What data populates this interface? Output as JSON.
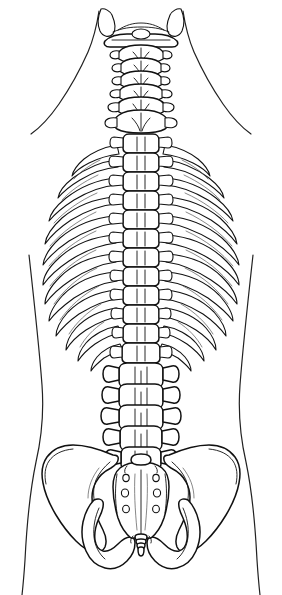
{
  "figure": {
    "view": "posterior",
    "background_color": "#ffffff",
    "line_color": "#111111",
    "silhouette_color": "#222222",
    "width": 282,
    "height": 595
  },
  "regions": [
    {
      "id": "skull-base",
      "label": "Skull base / mastoid processes",
      "y_range": [
        8,
        40
      ]
    },
    {
      "id": "cervical-spine",
      "label": "Cervical spine",
      "vertebra_count": 7,
      "y_range": [
        30,
        140
      ]
    },
    {
      "id": "thoracic-spine",
      "label": "Thoracic spine",
      "vertebra_count": 12,
      "y_range": [
        140,
        365
      ]
    },
    {
      "id": "rib-cage",
      "label": "Rib cage",
      "rib_pairs": 12,
      "y_range": [
        145,
        370
      ],
      "x_range": [
        45,
        237
      ]
    },
    {
      "id": "lumbar-spine",
      "label": "Lumbar spine",
      "vertebra_count": 5,
      "y_range": [
        362,
        460
      ]
    },
    {
      "id": "sacrum",
      "label": "Sacrum",
      "foramina_pairs": 4,
      "y_range": [
        455,
        530
      ]
    },
    {
      "id": "coccyx",
      "label": "Coccyx",
      "segments": 4,
      "y_range": [
        528,
        560
      ]
    },
    {
      "id": "pelvis-left",
      "label": "Left hip bone / ilium",
      "y_range": [
        430,
        570
      ]
    },
    {
      "id": "pelvis-right",
      "label": "Right hip bone / ilium",
      "y_range": [
        430,
        570
      ]
    },
    {
      "id": "body-silhouette",
      "label": "Body contour (neck, shoulders, waist, hips)",
      "y_range": [
        10,
        595
      ]
    }
  ],
  "cervical_vertebrae": [
    {
      "name": "C1 atlas",
      "cy": 40,
      "half_width": 36,
      "body_w": 13,
      "body_h": 7
    },
    {
      "name": "C2 axis",
      "cy": 53,
      "half_width": 20,
      "body_w": 13,
      "body_h": 9
    },
    {
      "name": "C3",
      "cy": 66,
      "half_width": 19,
      "body_w": 13,
      "body_h": 9
    },
    {
      "name": "C4",
      "cy": 79,
      "half_width": 19,
      "body_w": 13,
      "body_h": 9
    },
    {
      "name": "C5",
      "cy": 92,
      "half_width": 20,
      "body_w": 13,
      "body_h": 9
    },
    {
      "name": "C6",
      "cy": 105,
      "half_width": 21,
      "body_w": 14,
      "body_h": 10
    },
    {
      "name": "C7",
      "cy": 120,
      "half_width": 24,
      "body_w": 15,
      "body_h": 11
    }
  ],
  "thoracic_vertebrae": [
    {
      "name": "T1",
      "cy": 140,
      "half_width": 27
    },
    {
      "name": "T2",
      "cy": 159,
      "half_width": 27
    },
    {
      "name": "T3",
      "cy": 178,
      "half_width": 27
    },
    {
      "name": "T4",
      "cy": 197,
      "half_width": 27
    },
    {
      "name": "T5",
      "cy": 216,
      "half_width": 27
    },
    {
      "name": "T6",
      "cy": 235,
      "half_width": 27
    },
    {
      "name": "T7",
      "cy": 254,
      "half_width": 27
    },
    {
      "name": "T8",
      "cy": 272,
      "half_width": 26
    },
    {
      "name": "T9",
      "cy": 290,
      "half_width": 26
    },
    {
      "name": "T10",
      "cy": 308,
      "half_width": 25
    },
    {
      "name": "T11",
      "cy": 326,
      "half_width": 24
    },
    {
      "name": "T12",
      "cy": 345,
      "half_width": 23
    }
  ],
  "lumbar_vertebrae": [
    {
      "name": "L1",
      "cy": 372,
      "half_width": 34
    },
    {
      "name": "L2",
      "cy": 393,
      "half_width": 35
    },
    {
      "name": "L3",
      "cy": 414,
      "half_width": 36
    },
    {
      "name": "L4",
      "cy": 434,
      "half_width": 34
    },
    {
      "name": "L5",
      "cy": 455,
      "half_width": 31
    }
  ],
  "sacral_foramina": {
    "rows": [
      478,
      495,
      510
    ],
    "extra_row": 464,
    "x_offset": 16,
    "center_x": 141
  },
  "rib_pairs": [
    {
      "index": 1,
      "y_spine": 145,
      "y_out": 163,
      "x_out": 73
    },
    {
      "index": 2,
      "y_spine": 160,
      "y_out": 182,
      "x_out": 62
    },
    {
      "index": 3,
      "y_spine": 178,
      "y_out": 203,
      "x_out": 54
    },
    {
      "index": 4,
      "y_spine": 197,
      "y_out": 224,
      "x_out": 49
    },
    {
      "index": 5,
      "y_spine": 216,
      "y_out": 245,
      "x_out": 46
    },
    {
      "index": 6,
      "y_spine": 235,
      "y_out": 266,
      "x_out": 45
    },
    {
      "index": 7,
      "y_spine": 254,
      "y_out": 287,
      "x_out": 46
    },
    {
      "index": 8,
      "y_spine": 272,
      "y_out": 306,
      "x_out": 49
    },
    {
      "index": 9,
      "y_spine": 290,
      "y_out": 325,
      "x_out": 54
    },
    {
      "index": 10,
      "y_spine": 308,
      "y_out": 343,
      "x_out": 61
    },
    {
      "index": 11,
      "y_spine": 326,
      "y_out": 358,
      "x_out": 70
    },
    {
      "index": 12,
      "y_spine": 345,
      "y_out": 370,
      "x_out": 82
    }
  ]
}
